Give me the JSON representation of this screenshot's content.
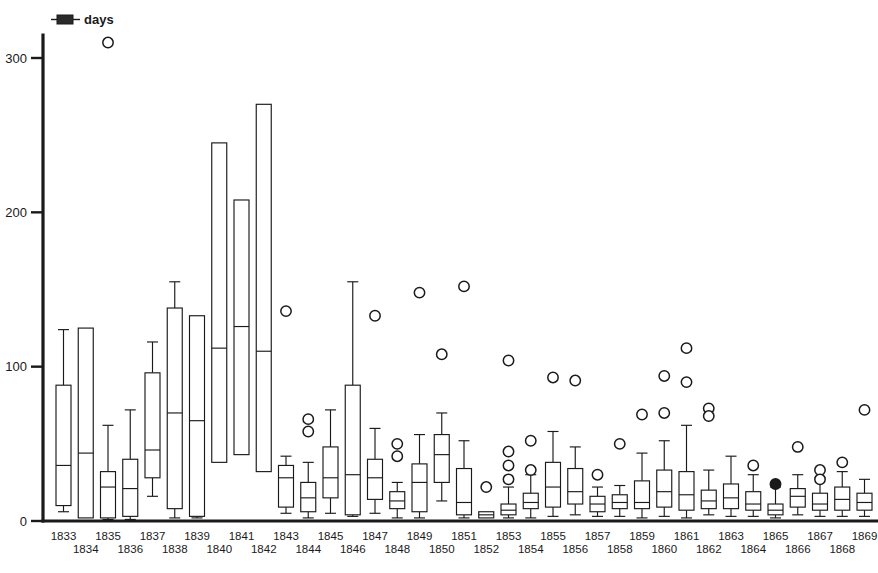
{
  "chart_data": {
    "type": "box",
    "title": "",
    "subtitle": "",
    "xlabel": "",
    "ylabel": "days",
    "legend": {
      "position": "top-left",
      "entries": [
        {
          "label": "days",
          "glyph": "boxplot-glyph"
        }
      ]
    },
    "grid": false,
    "xlim": [
      1832.3,
      1869.7
    ],
    "ylim": [
      0,
      320
    ],
    "yticks": [
      0,
      100,
      200,
      300
    ],
    "ytick_labels": [
      "0",
      "100",
      "200",
      "300"
    ],
    "x_label_rows": 2,
    "categories": [
      "1833",
      "1834",
      "1835",
      "1836",
      "1837",
      "1838",
      "1839",
      "1840",
      "1841",
      "1842",
      "1843",
      "1844",
      "1845",
      "1846",
      "1847",
      "1848",
      "1849",
      "1850",
      "1851",
      "1852",
      "1853",
      "1854",
      "1855",
      "1856",
      "1857",
      "1858",
      "1859",
      "1860",
      "1861",
      "1862",
      "1863",
      "1864",
      "1865",
      "1866",
      "1867",
      "1868",
      "1869"
    ],
    "boxes": [
      {
        "year": "1833",
        "whisker_low": 6,
        "q1": 10,
        "median": 36,
        "q3": 88,
        "whisker_high": 124,
        "outliers": []
      },
      {
        "year": "1834",
        "whisker_low": 2,
        "q1": 2,
        "median": 44,
        "q3": 125,
        "whisker_high": 125,
        "outliers": []
      },
      {
        "year": "1835",
        "whisker_low": 1,
        "q1": 2,
        "median": 22,
        "q3": 32,
        "whisker_high": 62,
        "outliers": [
          310
        ]
      },
      {
        "year": "1836",
        "whisker_low": 1,
        "q1": 3,
        "median": 21,
        "q3": 40,
        "whisker_high": 72,
        "outliers": []
      },
      {
        "year": "1837",
        "whisker_low": 16,
        "q1": 28,
        "median": 46,
        "q3": 96,
        "whisker_high": 116,
        "outliers": []
      },
      {
        "year": "1838",
        "whisker_low": 2,
        "q1": 8,
        "median": 70,
        "q3": 138,
        "whisker_high": 155,
        "outliers": []
      },
      {
        "year": "1839",
        "whisker_low": 2,
        "q1": 3,
        "median": 65,
        "q3": 133,
        "whisker_high": 133,
        "outliers": []
      },
      {
        "year": "1840",
        "whisker_low": 38,
        "q1": 38,
        "median": 112,
        "q3": 245,
        "whisker_high": 245,
        "outliers": []
      },
      {
        "year": "1841",
        "whisker_low": 43,
        "q1": 43,
        "median": 126,
        "q3": 208,
        "whisker_high": 208,
        "outliers": []
      },
      {
        "year": "1842",
        "whisker_low": 32,
        "q1": 32,
        "median": 110,
        "q3": 270,
        "whisker_high": 270,
        "outliers": []
      },
      {
        "year": "1843",
        "whisker_low": 5,
        "q1": 9,
        "median": 28,
        "q3": 36,
        "whisker_high": 42,
        "outliers": [
          136
        ]
      },
      {
        "year": "1844",
        "whisker_low": 2,
        "q1": 6,
        "median": 15,
        "q3": 25,
        "whisker_high": 38,
        "outliers": [
          66,
          58
        ]
      },
      {
        "year": "1845",
        "whisker_low": 5,
        "q1": 15,
        "median": 28,
        "q3": 48,
        "whisker_high": 72,
        "outliers": []
      },
      {
        "year": "1846",
        "whisker_low": 3,
        "q1": 4,
        "median": 30,
        "q3": 88,
        "whisker_high": 155,
        "outliers": []
      },
      {
        "year": "1847",
        "whisker_low": 5,
        "q1": 14,
        "median": 28,
        "q3": 40,
        "whisker_high": 60,
        "outliers": [
          133
        ]
      },
      {
        "year": "1848",
        "whisker_low": 2,
        "q1": 8,
        "median": 13,
        "q3": 19,
        "whisker_high": 25,
        "outliers": [
          50,
          42
        ]
      },
      {
        "year": "1849",
        "whisker_low": 2,
        "q1": 6,
        "median": 25,
        "q3": 37,
        "whisker_high": 56,
        "outliers": [
          148
        ]
      },
      {
        "year": "1850",
        "whisker_low": 13,
        "q1": 25,
        "median": 43,
        "q3": 56,
        "whisker_high": 70,
        "outliers": [
          108
        ]
      },
      {
        "year": "1851",
        "whisker_low": 2,
        "q1": 4,
        "median": 12,
        "q3": 34,
        "whisker_high": 52,
        "outliers": [
          152
        ]
      },
      {
        "year": "1852",
        "whisker_low": 2,
        "q1": 2,
        "median": 4,
        "q3": 6,
        "whisker_high": 6,
        "outliers": [
          22
        ]
      },
      {
        "year": "1853",
        "whisker_low": 2,
        "q1": 4,
        "median": 7,
        "q3": 11,
        "whisker_high": 22,
        "outliers": [
          104,
          45,
          36,
          27
        ]
      },
      {
        "year": "1854",
        "whisker_low": 2,
        "q1": 8,
        "median": 12,
        "q3": 18,
        "whisker_high": 30,
        "outliers": [
          52,
          33
        ]
      },
      {
        "year": "1855",
        "whisker_low": 3,
        "q1": 9,
        "median": 22,
        "q3": 38,
        "whisker_high": 58,
        "outliers": [
          93
        ]
      },
      {
        "year": "1856",
        "whisker_low": 4,
        "q1": 11,
        "median": 19,
        "q3": 34,
        "whisker_high": 48,
        "outliers": [
          91
        ]
      },
      {
        "year": "1857",
        "whisker_low": 3,
        "q1": 6,
        "median": 11,
        "q3": 16,
        "whisker_high": 22,
        "outliers": [
          30
        ]
      },
      {
        "year": "1858",
        "whisker_low": 3,
        "q1": 8,
        "median": 12,
        "q3": 17,
        "whisker_high": 23,
        "outliers": [
          50
        ]
      },
      {
        "year": "1859",
        "whisker_low": 2,
        "q1": 8,
        "median": 12,
        "q3": 26,
        "whisker_high": 44,
        "outliers": [
          69
        ]
      },
      {
        "year": "1860",
        "whisker_low": 3,
        "q1": 9,
        "median": 19,
        "q3": 33,
        "whisker_high": 52,
        "outliers": [
          94,
          70
        ]
      },
      {
        "year": "1861",
        "whisker_low": 2,
        "q1": 7,
        "median": 17,
        "q3": 32,
        "whisker_high": 62,
        "outliers": [
          112,
          90
        ]
      },
      {
        "year": "1862",
        "whisker_low": 4,
        "q1": 8,
        "median": 13,
        "q3": 20,
        "whisker_high": 33,
        "outliers": [
          73,
          68
        ]
      },
      {
        "year": "1863",
        "whisker_low": 3,
        "q1": 8,
        "median": 15,
        "q3": 24,
        "whisker_high": 42,
        "outliers": []
      },
      {
        "year": "1864",
        "whisker_low": 3,
        "q1": 7,
        "median": 11,
        "q3": 19,
        "whisker_high": 30,
        "outliers": [
          36
        ]
      },
      {
        "year": "1865",
        "whisker_low": 2,
        "q1": 4,
        "median": 7,
        "q3": 11,
        "whisker_high": 22,
        "outliers": [
          24
        ]
      },
      {
        "year": "1866",
        "whisker_low": 4,
        "q1": 9,
        "median": 16,
        "q3": 21,
        "whisker_high": 30,
        "outliers": [
          48
        ]
      },
      {
        "year": "1867",
        "whisker_low": 3,
        "q1": 7,
        "median": 11,
        "q3": 18,
        "whisker_high": 28,
        "outliers": [
          33,
          27
        ]
      },
      {
        "year": "1868",
        "whisker_low": 3,
        "q1": 7,
        "median": 14,
        "q3": 22,
        "whisker_high": 32,
        "outliers": [
          38
        ]
      },
      {
        "year": "1869",
        "whisker_low": 3,
        "q1": 7,
        "median": 12,
        "q3": 18,
        "whisker_high": 27,
        "outliers": [
          72
        ]
      }
    ],
    "colors": {
      "axis": "#1a1a1a",
      "box_stroke": "#1a1a1a",
      "box_fill": "#ffffff",
      "outlier_stroke": "#1a1a1a",
      "background": "#ffffff"
    },
    "filled_outliers": [
      "1865"
    ]
  }
}
